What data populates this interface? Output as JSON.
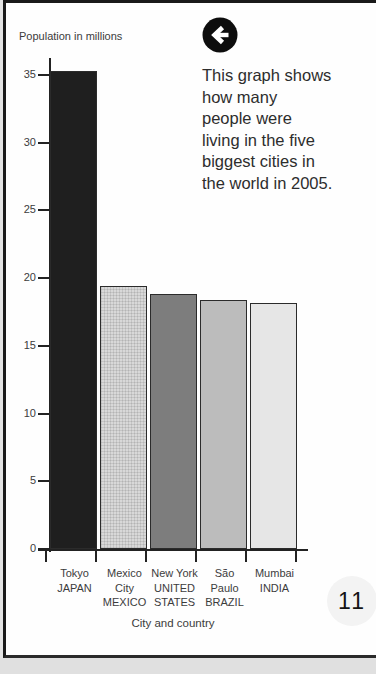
{
  "page_number": "11",
  "annotation": {
    "icon": "left-arrow",
    "text": "This graph shows how many people were living in the five biggest cities in the world in 2005.",
    "lines": [
      "This graph shows",
      "how many",
      "people were",
      "living in the five",
      "biggest cities in",
      "the world in 2005."
    ]
  },
  "chart_data": {
    "type": "bar",
    "title": "",
    "ylabel": "Population in millions",
    "xlabel": "City and country",
    "categories": [
      "Tokyo JAPAN",
      "Mexico City MEXICO",
      "New York UNITED STATES",
      "São Paulo BRAZIL",
      "Mumbai INDIA"
    ],
    "category_lines": [
      [
        "Tokyo",
        "JAPAN"
      ],
      [
        "Mexico",
        "City",
        "MEXICO"
      ],
      [
        "New York",
        "UNITED",
        "STATES"
      ],
      [
        "São",
        "Paulo",
        "BRAZIL"
      ],
      [
        "Mumbai",
        "INDIA"
      ]
    ],
    "values": [
      35.3,
      19.4,
      18.8,
      18.4,
      18.2
    ],
    "bar_colors": [
      "#1f1f1f",
      "#d8d8d8",
      "#7d7d7d",
      "#bcbcbc",
      "#e6e6e6"
    ],
    "bar_textures": [
      "none",
      "grid",
      "none",
      "none",
      "none"
    ],
    "y_ticks": [
      0,
      5,
      10,
      15,
      20,
      25,
      30,
      35
    ],
    "ylim": [
      0,
      36.5
    ],
    "grid": false,
    "legend_position": "none"
  },
  "colors": {
    "page_border": "#1a1a1a",
    "page_background": "#fefefe",
    "outside_background": "#e3e3e3",
    "axis": "#222222",
    "label_text": "#3c3c3c",
    "annotation_text": "#2d2d2d",
    "page_number_circle": "#f3f3f3"
  }
}
